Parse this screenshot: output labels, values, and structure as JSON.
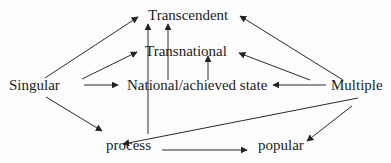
{
  "diagram": {
    "nodes": {
      "transcendent": "Transcendent",
      "transnational": "Transnational",
      "singular": "Singular",
      "national": "National/achieved state",
      "multiple": "Multiple",
      "process": "process",
      "popular": "popular"
    },
    "edges": [
      {
        "from": "Singular",
        "to": "Transcendent"
      },
      {
        "from": "Singular",
        "to": "Transnational"
      },
      {
        "from": "Singular",
        "to": "National/achieved state"
      },
      {
        "from": "Singular",
        "to": "process"
      },
      {
        "from": "process",
        "to": "Transcendent"
      },
      {
        "from": "National/achieved state",
        "to": "Transcendent"
      },
      {
        "from": "National/achieved state",
        "to": "Transnational"
      },
      {
        "from": "Multiple",
        "to": "Transcendent"
      },
      {
        "from": "Multiple",
        "to": "Transnational"
      },
      {
        "from": "Multiple",
        "to": "National/achieved state"
      },
      {
        "from": "Multiple",
        "to": "process"
      },
      {
        "from": "Multiple",
        "to": "popular"
      },
      {
        "from": "process",
        "to": "popular"
      }
    ],
    "colors": {
      "line": "#2a2a2a",
      "text": "#1c1c1c",
      "background": "#fdfdfd"
    }
  }
}
